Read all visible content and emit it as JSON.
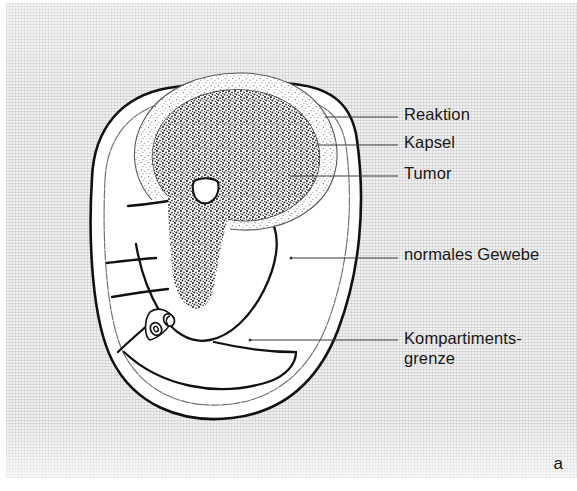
{
  "figure": {
    "type": "anatomical-diagram",
    "panel_letter": "a",
    "language": "de"
  },
  "labels": [
    {
      "id": "reaktion",
      "text": "Reaktion",
      "x": 404,
      "y": 105,
      "leader": {
        "x1": 325,
        "y1": 117,
        "x2": 398,
        "y2": 117
      }
    },
    {
      "id": "kapsel",
      "text": "Kapsel",
      "x": 404,
      "y": 133,
      "leader": {
        "x1": 316,
        "y1": 145,
        "x2": 398,
        "y2": 145
      }
    },
    {
      "id": "tumor",
      "text": "Tumor",
      "x": 404,
      "y": 164,
      "leader": {
        "x1": 290,
        "y1": 176,
        "x2": 398,
        "y2": 176
      }
    },
    {
      "id": "normales-gewebe",
      "text": "normales Gewebe",
      "x": 404,
      "y": 245,
      "leader": {
        "x1": 291,
        "y1": 258,
        "x2": 398,
        "y2": 258
      }
    },
    {
      "id": "kompartimentsgrenze",
      "text": "Kompartiments-\ngrenze",
      "x": 404,
      "y": 328,
      "leader": {
        "x1": 250,
        "y1": 340,
        "x2": 398,
        "y2": 340
      }
    }
  ],
  "label_lines": {
    "kompartimentsgrenze_line1": "Kompartiments-",
    "kompartimentsgrenze_line2": "grenze"
  },
  "colors": {
    "ink": "#111111",
    "paper": "#f0f0f0",
    "tumor_core": "#5a5a5a",
    "reaction_rim": "#9a9a9a",
    "leader": "#3a3a3a"
  },
  "structures": [
    {
      "name": "limb-outline",
      "description": "outer skin contour of limb cross-section"
    },
    {
      "name": "fascia-line",
      "description": "thin wavy deep fascia paralleling skin"
    },
    {
      "name": "tumor-mass",
      "description": "dense stippled tumor occupying posterior compartment"
    },
    {
      "name": "reaction-zone",
      "description": "light stippled rim surrounding tumor"
    },
    {
      "name": "capsule",
      "description": "thin line between tumor and reaction zone"
    },
    {
      "name": "bone",
      "description": "small white shield-shaped bone inside tumor area"
    },
    {
      "name": "compartment-septa",
      "description": "intermuscular septa dividing compartments"
    },
    {
      "name": "neurovascular-bundle",
      "description": "three small vessel ovals at septal junction"
    }
  ]
}
